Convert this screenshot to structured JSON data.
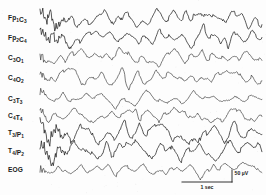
{
  "figure": {
    "background_color": "#fdfdfd",
    "ink_color": "#2a2a2a",
    "width": 266,
    "height": 195
  },
  "calibration": {
    "time_label": "1 sec",
    "amplitude_label": "50 µV",
    "amplitude_value": 50,
    "amplitude_unit": "µV",
    "time_value": 1,
    "time_unit": "sec"
  },
  "chart_data": {
    "type": "line",
    "xlabel": "Time",
    "ylabel": "Channel",
    "grid": false,
    "legend": "none",
    "x_unit": "sec",
    "y_unit": "µV",
    "time_span_sec": 10.5,
    "amplitude_scale_uv_per_div": 50,
    "channel_count": 9,
    "categories": [
      "Fp1C3",
      "Fp2C4",
      "C3O1",
      "C4O2",
      "C3T3",
      "C4T4",
      "T3/P1",
      "T4/P2",
      "EOG"
    ],
    "series": [
      {
        "name": "Fp1C3",
        "label_main": "F",
        "label_parts": [
          {
            "text": "F",
            "sub": false
          },
          {
            "text": "p",
            "sub": false
          },
          {
            "text": "1",
            "sub": true
          },
          {
            "text": "C",
            "sub": false
          },
          {
            "text": "3",
            "sub": true
          }
        ],
        "baseline_y": 18,
        "amplitude": 7.0,
        "density": "high",
        "seed": 11,
        "description": "Frontal-central left; dense spike bursts at recording onset"
      },
      {
        "name": "Fp2C4",
        "label_parts": [
          {
            "text": "F",
            "sub": false
          },
          {
            "text": "p",
            "sub": false
          },
          {
            "text": "2",
            "sub": true
          },
          {
            "text": "C",
            "sub": false
          },
          {
            "text": "4",
            "sub": true
          }
        ],
        "baseline_y": 38,
        "amplitude": 7.0,
        "density": "high",
        "seed": 23,
        "description": "Frontal-central right; dense spike bursts at onset"
      },
      {
        "name": "C3O1",
        "label_parts": [
          {
            "text": "C",
            "sub": false
          },
          {
            "text": "3",
            "sub": true
          },
          {
            "text": "O",
            "sub": false
          },
          {
            "text": "1",
            "sub": true
          }
        ],
        "baseline_y": 58,
        "amplitude": 6.4,
        "density": "medium",
        "seed": 37,
        "description": "Central-occipital left; sharp negative transients"
      },
      {
        "name": "C4O2",
        "label_parts": [
          {
            "text": "C",
            "sub": false
          },
          {
            "text": "4",
            "sub": true
          },
          {
            "text": "O",
            "sub": false
          },
          {
            "text": "2",
            "sub": true
          }
        ],
        "baseline_y": 78,
        "amplitude": 6.4,
        "density": "medium",
        "seed": 41,
        "description": "Central-occipital right; sharp negative transients"
      },
      {
        "name": "C3T3",
        "label_parts": [
          {
            "text": "C",
            "sub": false
          },
          {
            "text": "3",
            "sub": true
          },
          {
            "text": "T",
            "sub": false
          },
          {
            "text": "3",
            "sub": true
          }
        ],
        "baseline_y": 99,
        "amplitude": 5.2,
        "density": "low",
        "seed": 53,
        "description": "Central-temporal left; lower amplitude slow waves"
      },
      {
        "name": "C4T4",
        "label_parts": [
          {
            "text": "C",
            "sub": false
          },
          {
            "text": "4",
            "sub": true
          },
          {
            "text": "T",
            "sub": false
          },
          {
            "text": "4",
            "sub": true
          }
        ],
        "baseline_y": 116,
        "amplitude": 6.0,
        "density": "medium",
        "seed": 67,
        "description": "Central-temporal right; rhythmic sharp waves"
      },
      {
        "name": "T3/P1",
        "label_parts": [
          {
            "text": "T",
            "sub": false
          },
          {
            "text": "3",
            "sub": true
          },
          {
            "text": "/P",
            "sub": false
          },
          {
            "text": "1",
            "sub": true
          }
        ],
        "baseline_y": 133,
        "amplitude": 8.2,
        "density": "high",
        "seed": 73,
        "description": "Temporal-parietal left; highest amplitude sharp transients"
      },
      {
        "name": "T4/P2",
        "label_parts": [
          {
            "text": "T",
            "sub": false
          },
          {
            "text": "4",
            "sub": true
          },
          {
            "text": "/P",
            "sub": false
          },
          {
            "text": "2",
            "sub": true
          }
        ],
        "baseline_y": 151,
        "amplitude": 8.0,
        "density": "high",
        "seed": 89,
        "description": "Temporal-parietal right; high amplitude sharp transients"
      },
      {
        "name": "EOG",
        "label_parts": [
          {
            "text": "EOG",
            "sub": false
          }
        ],
        "baseline_y": 170,
        "amplitude": 5.0,
        "density": "low",
        "seed": 97,
        "description": "Electro-oculogram; slow low amplitude eye movement deflections"
      }
    ]
  },
  "layout": {
    "trace_x_start": 40,
    "trace_x_end": 262,
    "label_x": 8
  }
}
